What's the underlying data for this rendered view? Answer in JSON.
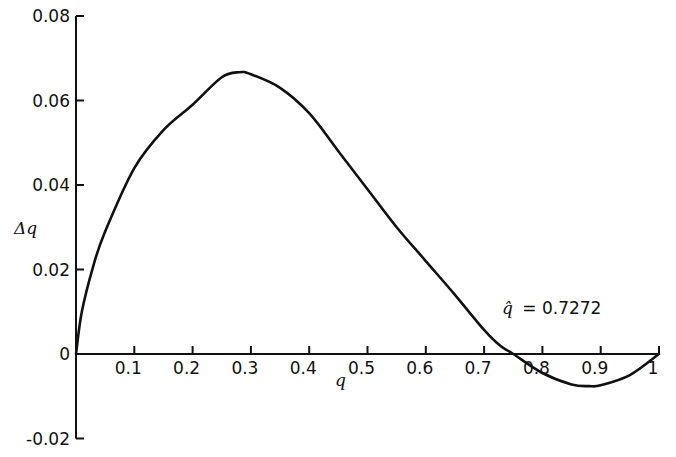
{
  "chart_data": {
    "type": "line",
    "title": "",
    "xlabel": "q",
    "ylabel": "Δq",
    "xlim": [
      0,
      1
    ],
    "ylim": [
      -0.02,
      0.08
    ],
    "grid": false,
    "legend": null,
    "x_ticks": [
      "0.1",
      "0.2",
      "0.3",
      "0.4",
      "0.5",
      "0.6",
      "0.7",
      "0.8",
      "0.9",
      "1"
    ],
    "y_ticks": [
      "0.08",
      "0.06",
      "0.04",
      "0.02",
      "0",
      "-0.02"
    ],
    "series": [
      {
        "name": "Δq",
        "x": [
          0,
          0.01,
          0.03,
          0.05,
          0.1,
          0.15,
          0.2,
          0.25,
          0.28,
          0.3,
          0.35,
          0.4,
          0.45,
          0.5,
          0.55,
          0.6,
          0.65,
          0.7,
          0.7272,
          0.75,
          0.8,
          0.85,
          0.88,
          0.9,
          0.95,
          1.0
        ],
        "values": [
          0,
          0.01,
          0.021,
          0.029,
          0.044,
          0.053,
          0.059,
          0.0655,
          0.0667,
          0.0662,
          0.063,
          0.057,
          0.048,
          0.039,
          0.03,
          0.022,
          0.014,
          0.0057,
          0.002,
          0,
          -0.0045,
          -0.0072,
          -0.0076,
          -0.0074,
          -0.005,
          0
        ]
      }
    ],
    "annotations": [
      {
        "text": "q̂ = 0.7272",
        "x": 0.76,
        "y": 0.011
      }
    ]
  },
  "labels": {
    "xlabel": "q",
    "ylabel": "Δq",
    "annotation_symbol": "q̂",
    "annotation_value": "= 0.7272"
  }
}
